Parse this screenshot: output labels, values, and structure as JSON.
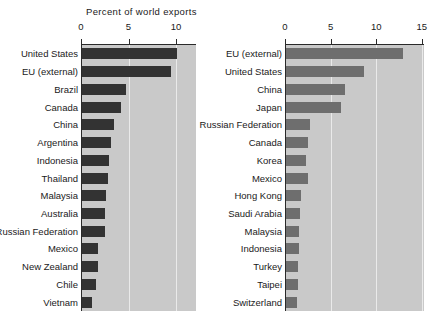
{
  "chart_data": [
    {
      "type": "bar",
      "orientation": "horizontal",
      "title": "Percent of world exports",
      "xlabel": "",
      "ylabel": "",
      "xlim": [
        0,
        11.7
      ],
      "xticks": [
        0,
        5,
        10
      ],
      "xticklabels": [
        "0",
        "5",
        "10"
      ],
      "grid": true,
      "legend": "none",
      "bar_color": "#333333",
      "plot_background": "#c9c9c9",
      "categories": [
        "United States",
        "EU (external)",
        "Brazil",
        "Canada",
        "China",
        "Argentina",
        "Indonesia",
        "Thailand",
        "Malaysia",
        "Australia",
        "Russian Federation",
        "Mexico",
        "New Zealand",
        "Chile",
        "Vietnam"
      ],
      "values": [
        10.0,
        9.4,
        4.6,
        4.1,
        3.4,
        3.1,
        2.8,
        2.7,
        2.5,
        2.4,
        2.4,
        1.7,
        1.7,
        1.5,
        1.0
      ]
    },
    {
      "type": "bar",
      "orientation": "horizontal",
      "title": "Percent of world imports",
      "xlabel": "",
      "ylabel": "",
      "xlim": [
        0,
        15.3
      ],
      "xticks": [
        0,
        5,
        10,
        15
      ],
      "xticklabels": [
        "0",
        "5",
        "10",
        "15"
      ],
      "grid": true,
      "legend": "none",
      "bar_color": "#6e6e6e",
      "plot_background": "#c9c9c9",
      "categories": [
        "EU (external)",
        "United States",
        "China",
        "Japan",
        "Russian Federation",
        "Canada",
        "Korea",
        "Mexico",
        "Hong Kong",
        "Saudi Arabia",
        "Malaysia",
        "Indonesia",
        "Turkey",
        "Taipei",
        "Switzerland"
      ],
      "values": [
        12.8,
        8.5,
        6.5,
        6.0,
        2.6,
        2.4,
        2.2,
        2.4,
        1.6,
        1.5,
        1.4,
        1.4,
        1.3,
        1.3,
        1.2
      ]
    }
  ],
  "panels": {
    "exports": {
      "title": "Percent of world exports",
      "ticklabels": [
        "0",
        "5",
        "10"
      ],
      "categories": [
        "United States",
        "EU (external)",
        "Brazil",
        "Canada",
        "China",
        "Argentina",
        "Indonesia",
        "Thailand",
        "Malaysia",
        "Australia",
        "Russian Federation",
        "Mexico",
        "New Zealand",
        "Chile",
        "Vietnam"
      ]
    },
    "imports": {
      "title": "Percent of world imports",
      "ticklabels": [
        "0",
        "5",
        "10",
        "15"
      ],
      "categories": [
        "EU (external)",
        "United States",
        "China",
        "Japan",
        "Russian Federation",
        "Canada",
        "Korea",
        "Mexico",
        "Hong Kong",
        "Saudi Arabia",
        "Malaysia",
        "Indonesia",
        "Turkey",
        "Taipei",
        "Switzerland"
      ]
    }
  }
}
